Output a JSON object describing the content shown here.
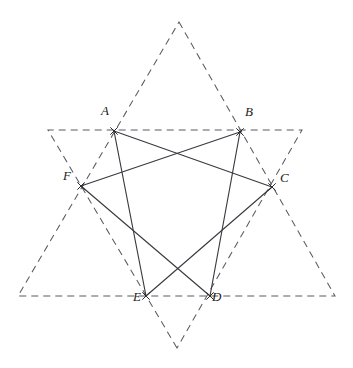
{
  "figure": {
    "background_color": "#ffffff",
    "dashed_color": "#5a5a62",
    "solid_color": "#3a3a40",
    "label_color": "#1b1b20",
    "width": 353,
    "height": 368
  },
  "labels": {
    "A": "A",
    "B": "B",
    "C": "C",
    "D": "D",
    "E": "E",
    "F": "F"
  },
  "chart_data": {
    "type": "scatter",
    "xlabel": "",
    "ylabel": "",
    "xlim": [
      0,
      353
    ],
    "ylim": [
      368,
      0
    ],
    "grid": false,
    "legend": "none",
    "points": [
      {
        "name": "A",
        "x": 114,
        "y": 131,
        "label": "A",
        "label_dx": -13,
        "label_dy": -17
      },
      {
        "name": "B",
        "x": 240,
        "y": 132,
        "label": "B",
        "label_dx": 5,
        "label_dy": -17
      },
      {
        "name": "C",
        "x": 272,
        "y": 187,
        "label": "C",
        "label_dx": 8,
        "label_dy": -6
      },
      {
        "name": "D",
        "x": 210,
        "y": 296,
        "label": "D",
        "label_dx": 2,
        "label_dy": 4
      },
      {
        "name": "E",
        "x": 146,
        "y": 296,
        "label": "E",
        "label_dx": -13,
        "label_dy": 4
      },
      {
        "name": "F",
        "x": 81,
        "y": 186,
        "label": "F",
        "label_dx": -18,
        "label_dy": -7
      }
    ],
    "star_points": [
      {
        "name": "top-apex",
        "x": 179,
        "y": 22
      },
      {
        "name": "bottom-apex",
        "x": 177,
        "y": 348
      },
      {
        "name": "upper-left-apex",
        "x": 48,
        "y": 130
      },
      {
        "name": "upper-right-apex",
        "x": 302,
        "y": 130
      },
      {
        "name": "lower-left-apex",
        "x": 18,
        "y": 296
      },
      {
        "name": "lower-right-apex",
        "x": 335,
        "y": 296
      }
    ],
    "dashed_triangles": [
      {
        "name": "upward-triangle",
        "vertices": [
          "top-apex",
          "lower-right-apex",
          "lower-left-apex"
        ]
      },
      {
        "name": "downward-triangle",
        "vertices": [
          "bottom-apex",
          "upper-left-apex",
          "upper-right-apex"
        ]
      }
    ],
    "solid_edges": [
      {
        "name": "A-C",
        "from": "A",
        "to": "C"
      },
      {
        "name": "B-F",
        "from": "B",
        "to": "F"
      },
      {
        "name": "A-E",
        "from": "A",
        "to": "E"
      },
      {
        "name": "B-D",
        "from": "B",
        "to": "D"
      },
      {
        "name": "F-D",
        "from": "F",
        "to": "D"
      },
      {
        "name": "C-E",
        "from": "C",
        "to": "E"
      }
    ]
  }
}
